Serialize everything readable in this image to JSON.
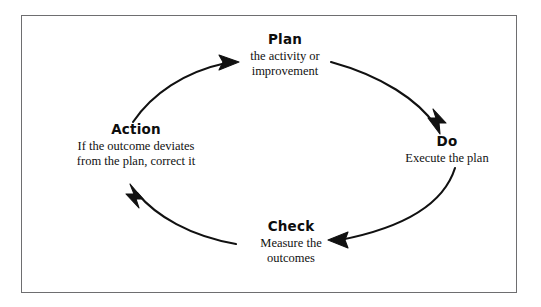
{
  "diagram": {
    "type": "pdca-cycle",
    "direction": "clockwise",
    "background_color": "#ffffff",
    "border_color": "#6e6e70",
    "stroke_color": "#111111",
    "nodes": [
      {
        "id": "plan",
        "title": "Plan",
        "description": "the activity or\nimprovement",
        "position": "top"
      },
      {
        "id": "do",
        "title": "Do",
        "description": "Execute the plan",
        "position": "right"
      },
      {
        "id": "check",
        "title": "Check",
        "description": "Measure the\noutcomes",
        "position": "bottom"
      },
      {
        "id": "action",
        "title": "Action",
        "description": "If the outcome deviates\nfrom the plan, correct it",
        "position": "left"
      }
    ],
    "arrows": [
      {
        "id": "plan-to-do",
        "from": "plan",
        "to": "do"
      },
      {
        "id": "do-to-check",
        "from": "do",
        "to": "check"
      },
      {
        "id": "check-to-action",
        "from": "check",
        "to": "action"
      },
      {
        "id": "action-to-plan",
        "from": "action",
        "to": "plan"
      }
    ]
  }
}
